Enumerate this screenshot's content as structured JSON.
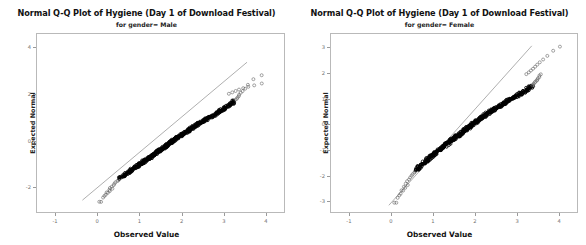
{
  "chart_data": [
    {
      "type": "scatter",
      "title": "Normal Q-Q Plot of Hygiene (Day 1 of Download Festival)",
      "subtitle": "for gender= Male",
      "xlabel": "Observed Value",
      "ylabel": "Expected Normal",
      "xlim": [
        -1.45,
        4.45
      ],
      "ylim": [
        -3.1,
        4.6
      ],
      "xticks": [
        "-1",
        "0",
        "1",
        "2",
        "3",
        "4"
      ],
      "xtickvalues": [
        -1,
        0,
        1,
        2,
        3,
        4
      ],
      "yticks": [
        "4",
        "2",
        "0",
        "-2"
      ],
      "ytickvalues": [
        4,
        2,
        0,
        -2
      ],
      "grid": false,
      "legend": null,
      "reference_line": {
        "x0": -0.35,
        "y0": -2.55,
        "x1": 3.55,
        "y1": 3.35
      },
      "marker": "open-circle",
      "points": [
        [
          0.09,
          -2.62
        ],
        [
          0.17,
          -2.38
        ],
        [
          0.22,
          -2.22
        ],
        [
          0.28,
          -2.12
        ],
        [
          0.31,
          -2.04
        ],
        [
          0.35,
          -1.97
        ],
        [
          0.38,
          -1.9
        ],
        [
          0.41,
          -1.84
        ],
        [
          0.44,
          -1.79
        ],
        [
          0.47,
          -1.74
        ],
        [
          0.5,
          -1.69
        ],
        [
          0.53,
          -1.64
        ],
        [
          0.56,
          -1.6
        ],
        [
          0.59,
          -1.56
        ],
        [
          0.62,
          -1.52
        ],
        [
          0.64,
          -1.48
        ],
        [
          0.67,
          -1.44
        ],
        [
          0.7,
          -1.41
        ],
        [
          0.73,
          -1.37
        ],
        [
          0.75,
          -1.34
        ],
        [
          0.78,
          -1.31
        ],
        [
          0.8,
          -1.27
        ],
        [
          0.83,
          -1.24
        ],
        [
          0.85,
          -1.21
        ],
        [
          0.88,
          -1.18
        ],
        [
          0.9,
          -1.15
        ],
        [
          0.92,
          -1.12
        ],
        [
          0.95,
          -1.1
        ],
        [
          0.97,
          -1.07
        ],
        [
          0.99,
          -1.04
        ],
        [
          1.01,
          -1.01
        ],
        [
          1.03,
          -0.99
        ],
        [
          1.05,
          -0.96
        ],
        [
          1.07,
          -0.94
        ],
        [
          1.09,
          -0.91
        ],
        [
          1.11,
          -0.89
        ],
        [
          1.13,
          -0.86
        ],
        [
          1.15,
          -0.84
        ],
        [
          1.17,
          -0.81
        ],
        [
          1.19,
          -0.79
        ],
        [
          1.21,
          -0.77
        ],
        [
          1.23,
          -0.74
        ],
        [
          1.25,
          -0.72
        ],
        [
          1.26,
          -0.7
        ],
        [
          1.28,
          -0.68
        ],
        [
          1.3,
          -0.65
        ],
        [
          1.32,
          -0.63
        ],
        [
          1.33,
          -0.61
        ],
        [
          1.35,
          -0.59
        ],
        [
          1.37,
          -0.57
        ],
        [
          1.38,
          -0.55
        ],
        [
          1.4,
          -0.52
        ],
        [
          1.42,
          -0.5
        ],
        [
          1.43,
          -0.48
        ],
        [
          1.45,
          -0.46
        ],
        [
          1.47,
          -0.44
        ],
        [
          1.48,
          -0.42
        ],
        [
          1.5,
          -0.4
        ],
        [
          1.51,
          -0.38
        ],
        [
          1.53,
          -0.36
        ],
        [
          1.55,
          -0.34
        ],
        [
          1.56,
          -0.32
        ],
        [
          1.58,
          -0.3
        ],
        [
          1.59,
          -0.28
        ],
        [
          1.61,
          -0.26
        ],
        [
          1.62,
          -0.24
        ],
        [
          1.64,
          -0.22
        ],
        [
          1.65,
          -0.2
        ],
        [
          1.67,
          -0.18
        ],
        [
          1.68,
          -0.16
        ],
        [
          1.7,
          -0.14
        ],
        [
          1.72,
          -0.12
        ],
        [
          1.73,
          -0.1
        ],
        [
          1.75,
          -0.08
        ],
        [
          1.76,
          -0.06
        ],
        [
          1.78,
          -0.04
        ],
        [
          1.79,
          -0.02
        ],
        [
          1.81,
          0.0
        ],
        [
          1.82,
          0.02
        ],
        [
          1.84,
          0.04
        ],
        [
          1.85,
          0.06
        ],
        [
          1.87,
          0.08
        ],
        [
          1.88,
          0.1
        ],
        [
          1.9,
          0.12
        ],
        [
          1.92,
          0.14
        ],
        [
          1.93,
          0.16
        ],
        [
          1.95,
          0.18
        ],
        [
          1.96,
          0.2
        ],
        [
          1.98,
          0.22
        ],
        [
          2.0,
          0.24
        ],
        [
          2.01,
          0.26
        ],
        [
          2.03,
          0.28
        ],
        [
          2.05,
          0.3
        ],
        [
          2.06,
          0.32
        ],
        [
          2.08,
          0.34
        ],
        [
          2.1,
          0.36
        ],
        [
          2.11,
          0.38
        ],
        [
          2.13,
          0.4
        ],
        [
          2.15,
          0.42
        ],
        [
          2.17,
          0.44
        ],
        [
          2.18,
          0.46
        ],
        [
          2.2,
          0.48
        ],
        [
          2.22,
          0.5
        ],
        [
          2.24,
          0.52
        ],
        [
          2.26,
          0.55
        ],
        [
          2.28,
          0.57
        ],
        [
          2.3,
          0.59
        ],
        [
          2.32,
          0.61
        ],
        [
          2.34,
          0.63
        ],
        [
          2.36,
          0.65
        ],
        [
          2.38,
          0.68
        ],
        [
          2.4,
          0.7
        ],
        [
          2.42,
          0.72
        ],
        [
          2.44,
          0.74
        ],
        [
          2.46,
          0.77
        ],
        [
          2.48,
          0.79
        ],
        [
          2.51,
          0.81
        ],
        [
          2.53,
          0.84
        ],
        [
          2.55,
          0.86
        ],
        [
          2.57,
          0.89
        ],
        [
          2.6,
          0.91
        ],
        [
          2.62,
          0.94
        ],
        [
          2.64,
          0.96
        ],
        [
          2.67,
          0.99
        ],
        [
          2.69,
          1.01
        ],
        [
          2.72,
          1.04
        ],
        [
          2.74,
          1.07
        ],
        [
          2.77,
          1.1
        ],
        [
          2.79,
          1.12
        ],
        [
          2.82,
          1.15
        ],
        [
          2.85,
          1.18
        ],
        [
          2.87,
          1.21
        ],
        [
          2.9,
          1.24
        ],
        [
          2.93,
          1.27
        ],
        [
          2.95,
          1.31
        ],
        [
          2.98,
          1.34
        ],
        [
          3.01,
          1.37
        ],
        [
          3.04,
          1.41
        ],
        [
          3.07,
          1.44
        ],
        [
          3.1,
          1.48
        ],
        [
          3.13,
          1.52
        ],
        [
          3.16,
          1.56
        ],
        [
          3.19,
          1.6
        ],
        [
          3.22,
          1.64
        ],
        [
          3.25,
          1.69
        ],
        [
          3.28,
          1.74
        ],
        [
          3.3,
          1.79
        ],
        [
          3.33,
          1.84
        ],
        [
          3.35,
          1.9
        ],
        [
          3.37,
          1.97
        ],
        [
          3.4,
          2.04
        ],
        [
          3.44,
          2.12
        ],
        [
          3.5,
          2.22
        ],
        [
          3.58,
          2.38
        ],
        [
          3.7,
          2.62
        ],
        [
          3.9,
          2.8
        ]
      ],
      "outliers_high": [
        [
          3.12,
          2.0
        ],
        [
          3.2,
          2.06
        ],
        [
          3.28,
          2.12
        ],
        [
          3.36,
          2.18
        ],
        [
          3.46,
          2.24
        ],
        [
          3.58,
          2.3
        ],
        [
          3.72,
          2.36
        ],
        [
          3.9,
          2.44
        ]
      ],
      "outliers_low": [
        [
          0.05,
          -2.62
        ],
        [
          0.14,
          -2.44
        ],
        [
          0.2,
          -2.32
        ],
        [
          0.25,
          -2.24
        ],
        [
          0.3,
          -2.16
        ],
        [
          0.36,
          -2.06
        ]
      ]
    },
    {
      "type": "scatter",
      "title": "Normal Q-Q Plot of Hygiene (Day 1 of Download Festival)",
      "subtitle": "for gender= Female",
      "xlabel": "Observed Value",
      "ylabel": "Expected Normal",
      "xlim": [
        -1.45,
        4.45
      ],
      "ylim": [
        -3.45,
        3.55
      ],
      "xticks": [
        "-1",
        "0",
        "1",
        "2",
        "3",
        "4"
      ],
      "xtickvalues": [
        -1,
        0,
        1,
        2,
        3,
        4
      ],
      "yticks": [
        "3",
        "2",
        "1",
        "0",
        "-1",
        "-2",
        "-3"
      ],
      "ytickvalues": [
        3,
        2,
        1,
        0,
        -1,
        -2,
        -3
      ],
      "grid": false,
      "legend": null,
      "reference_line": {
        "x0": -0.05,
        "y0": -3.15,
        "x1": 3.35,
        "y1": 3.05
      },
      "marker": "open-circle",
      "points": [
        [
          0.12,
          -3.05
        ],
        [
          0.2,
          -2.76
        ],
        [
          0.26,
          -2.56
        ],
        [
          0.31,
          -2.42
        ],
        [
          0.35,
          -2.31
        ],
        [
          0.39,
          -2.22
        ],
        [
          0.43,
          -2.14
        ],
        [
          0.46,
          -2.07
        ],
        [
          0.49,
          -2.0
        ],
        [
          0.52,
          -1.94
        ],
        [
          0.55,
          -1.89
        ],
        [
          0.58,
          -1.84
        ],
        [
          0.61,
          -1.79
        ],
        [
          0.63,
          -1.74
        ],
        [
          0.66,
          -1.7
        ],
        [
          0.68,
          -1.66
        ],
        [
          0.71,
          -1.62
        ],
        [
          0.73,
          -1.58
        ],
        [
          0.76,
          -1.54
        ],
        [
          0.78,
          -1.51
        ],
        [
          0.8,
          -1.47
        ],
        [
          0.83,
          -1.44
        ],
        [
          0.85,
          -1.41
        ],
        [
          0.87,
          -1.38
        ],
        [
          0.89,
          -1.34
        ],
        [
          0.92,
          -1.31
        ],
        [
          0.94,
          -1.28
        ],
        [
          0.96,
          -1.25
        ],
        [
          0.98,
          -1.23
        ],
        [
          1.0,
          -1.2
        ],
        [
          1.02,
          -1.17
        ],
        [
          1.04,
          -1.14
        ],
        [
          1.06,
          -1.12
        ],
        [
          1.08,
          -1.09
        ],
        [
          1.1,
          -1.06
        ],
        [
          1.12,
          -1.04
        ],
        [
          1.14,
          -1.01
        ],
        [
          1.16,
          -0.99
        ],
        [
          1.18,
          -0.96
        ],
        [
          1.2,
          -0.94
        ],
        [
          1.22,
          -0.91
        ],
        [
          1.24,
          -0.89
        ],
        [
          1.26,
          -0.86
        ],
        [
          1.28,
          -0.84
        ],
        [
          1.29,
          -0.82
        ],
        [
          1.31,
          -0.79
        ],
        [
          1.33,
          -0.77
        ],
        [
          1.35,
          -0.75
        ],
        [
          1.37,
          -0.72
        ],
        [
          1.38,
          -0.7
        ],
        [
          1.4,
          -0.68
        ],
        [
          1.42,
          -0.66
        ],
        [
          1.44,
          -0.63
        ],
        [
          1.45,
          -0.61
        ],
        [
          1.47,
          -0.59
        ],
        [
          1.49,
          -0.57
        ],
        [
          1.51,
          -0.55
        ],
        [
          1.52,
          -0.52
        ],
        [
          1.54,
          -0.5
        ],
        [
          1.56,
          -0.48
        ],
        [
          1.58,
          -0.46
        ],
        [
          1.59,
          -0.44
        ],
        [
          1.61,
          -0.42
        ],
        [
          1.63,
          -0.4
        ],
        [
          1.64,
          -0.38
        ],
        [
          1.66,
          -0.36
        ],
        [
          1.68,
          -0.34
        ],
        [
          1.69,
          -0.31
        ],
        [
          1.71,
          -0.29
        ],
        [
          1.73,
          -0.27
        ],
        [
          1.74,
          -0.25
        ],
        [
          1.76,
          -0.23
        ],
        [
          1.78,
          -0.21
        ],
        [
          1.79,
          -0.19
        ],
        [
          1.81,
          -0.17
        ],
        [
          1.83,
          -0.15
        ],
        [
          1.84,
          -0.13
        ],
        [
          1.86,
          -0.11
        ],
        [
          1.88,
          -0.09
        ],
        [
          1.89,
          -0.07
        ],
        [
          1.91,
          -0.05
        ],
        [
          1.93,
          -0.02
        ],
        [
          1.94,
          0.0
        ],
        [
          1.96,
          0.02
        ],
        [
          1.98,
          0.04
        ],
        [
          1.99,
          0.06
        ],
        [
          2.01,
          0.08
        ],
        [
          2.03,
          0.1
        ],
        [
          2.05,
          0.12
        ],
        [
          2.06,
          0.14
        ],
        [
          2.08,
          0.16
        ],
        [
          2.1,
          0.18
        ],
        [
          2.12,
          0.2
        ],
        [
          2.13,
          0.23
        ],
        [
          2.15,
          0.25
        ],
        [
          2.17,
          0.27
        ],
        [
          2.19,
          0.29
        ],
        [
          2.21,
          0.31
        ],
        [
          2.22,
          0.34
        ],
        [
          2.24,
          0.36
        ],
        [
          2.26,
          0.38
        ],
        [
          2.28,
          0.4
        ],
        [
          2.3,
          0.42
        ],
        [
          2.32,
          0.44
        ],
        [
          2.34,
          0.46
        ],
        [
          2.36,
          0.48
        ],
        [
          2.38,
          0.5
        ],
        [
          2.4,
          0.52
        ],
        [
          2.42,
          0.55
        ],
        [
          2.44,
          0.57
        ],
        [
          2.46,
          0.59
        ],
        [
          2.48,
          0.61
        ],
        [
          2.5,
          0.63
        ],
        [
          2.52,
          0.66
        ],
        [
          2.55,
          0.68
        ],
        [
          2.57,
          0.7
        ],
        [
          2.59,
          0.72
        ],
        [
          2.61,
          0.75
        ],
        [
          2.64,
          0.77
        ],
        [
          2.66,
          0.79
        ],
        [
          2.68,
          0.82
        ],
        [
          2.71,
          0.84
        ],
        [
          2.73,
          0.86
        ],
        [
          2.76,
          0.89
        ],
        [
          2.78,
          0.91
        ],
        [
          2.81,
          0.94
        ],
        [
          2.84,
          0.96
        ],
        [
          2.86,
          0.99
        ],
        [
          2.89,
          1.01
        ],
        [
          2.92,
          1.04
        ],
        [
          2.95,
          1.06
        ],
        [
          2.98,
          1.09
        ],
        [
          3.0,
          1.12
        ],
        [
          3.03,
          1.14
        ],
        [
          3.06,
          1.17
        ],
        [
          3.09,
          1.2
        ],
        [
          3.12,
          1.23
        ],
        [
          3.15,
          1.25
        ],
        [
          3.18,
          1.28
        ],
        [
          3.21,
          1.31
        ],
        [
          3.23,
          1.34
        ],
        [
          3.26,
          1.38
        ],
        [
          3.29,
          1.41
        ],
        [
          3.31,
          1.44
        ],
        [
          3.34,
          1.47
        ],
        [
          3.36,
          1.51
        ],
        [
          3.38,
          1.54
        ],
        [
          3.4,
          1.58
        ],
        [
          3.42,
          1.62
        ],
        [
          3.44,
          1.66
        ],
        [
          3.46,
          1.7
        ],
        [
          3.48,
          1.74
        ],
        [
          3.5,
          1.79
        ],
        [
          3.52,
          1.84
        ],
        [
          3.54,
          1.89
        ],
        [
          3.56,
          1.94
        ]
      ],
      "outliers_high": [
        [
          3.22,
          1.95
        ],
        [
          3.28,
          2.02
        ],
        [
          3.33,
          2.09
        ],
        [
          3.38,
          2.16
        ],
        [
          3.43,
          2.24
        ],
        [
          3.48,
          2.32
        ],
        [
          3.54,
          2.41
        ],
        [
          3.62,
          2.52
        ],
        [
          3.72,
          2.66
        ],
        [
          3.86,
          2.86
        ],
        [
          4.02,
          3.02
        ]
      ],
      "outliers_low": [
        [
          0.08,
          -3.05
        ],
        [
          0.16,
          -2.86
        ],
        [
          0.23,
          -2.7
        ],
        [
          0.29,
          -2.58
        ],
        [
          0.34,
          -2.47
        ],
        [
          0.4,
          -2.36
        ]
      ]
    }
  ]
}
